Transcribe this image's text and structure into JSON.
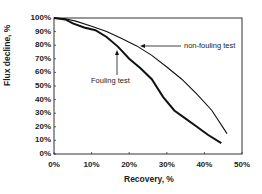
{
  "chart_data": {
    "type": "line",
    "title": "",
    "xlabel": "Recovery, %",
    "ylabel": "Flux decline, %",
    "xlim": [
      0,
      50
    ],
    "ylim": [
      0,
      100
    ],
    "x_ticks": [
      "0%",
      "10%",
      "20%",
      "30%",
      "40%",
      "50%"
    ],
    "y_ticks": [
      "0%",
      "10%",
      "20%",
      "30%",
      "40%",
      "50%",
      "60%",
      "70%",
      "80%",
      "90%",
      "100%"
    ],
    "grid": false,
    "legend": "none (inline annotations)",
    "series": [
      {
        "name": "non-fouling test",
        "x": [
          0,
          3,
          6,
          10,
          14,
          18,
          22,
          26,
          30,
          34,
          38,
          42,
          46
        ],
        "y": [
          100,
          99.5,
          97.5,
          94,
          90,
          85,
          79.5,
          72.5,
          64,
          55,
          44,
          32,
          15
        ],
        "annotation": "non-fouling test"
      },
      {
        "name": "Fouling test",
        "x": [
          0,
          3,
          5,
          8,
          11,
          14,
          17,
          20,
          23,
          26,
          29,
          32,
          35,
          38,
          41,
          44.5
        ],
        "y": [
          100,
          99,
          96,
          93,
          91,
          86,
          79,
          70,
          63,
          55,
          42,
          32,
          26,
          20,
          14,
          8
        ],
        "annotation": "Fouling test"
      }
    ],
    "annotations": [
      {
        "text": "non-fouling test",
        "arrow_to": [
          23,
          79
        ]
      },
      {
        "text": "Fouling test",
        "arrow_to": [
          17,
          78
        ]
      }
    ]
  }
}
